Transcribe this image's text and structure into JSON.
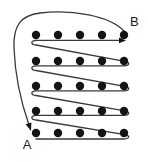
{
  "figure": {
    "background_color": "#ffffff",
    "width": 148,
    "height": 162
  },
  "labels": {
    "start": "A",
    "end": "B",
    "start_position": {
      "x": 27,
      "y": 149
    },
    "end_position": {
      "x": 130,
      "y": 26
    }
  },
  "colors": {
    "node": "#141414",
    "path": "#3a3a3a",
    "label": "#202020"
  },
  "grid": {
    "rows": 5,
    "columns": 5,
    "dot_radius": 4.2,
    "column_x": [
      36,
      58,
      80,
      102,
      124
    ],
    "row_y": [
      35,
      61,
      86,
      111,
      133
    ]
  },
  "paths": {
    "scan_path_d": "M 36 139 L 124 139 C 130 138.6 130 135.5 125 134.6 L 36 120 C 30.5 119.2 30.5 116 36 115.4 L 124 115.4 C 130 115 130 111.8 125 110.9 L 36 95.5 C 30.5 94.7 30.5 91.5 36 90.9 L 124 90.9 C 130 90.5 130 87.3 125 86.4 L 36 70.5 C 30.5 69.7 30.5 66.5 36 65.9 L 124 65.9 C 130 65.5 130 62.3 125 61.4 L 36 45 C 30.5 44.2 30.5 41 36 40.4 L 122 40.4",
    "scan_arrow_tip": {
      "x": 126,
      "y": 40.4
    },
    "return_path_d": "M 124 31 C 110 16 72 9 40 13 C 21 15.5 13 25 14 48 C 15 75 22 105 29 125",
    "return_arrow_tip": {
      "x": 31,
      "y": 131
    }
  },
  "nodes": [
    {
      "row": 0,
      "col": 0,
      "x": 36,
      "y": 35
    },
    {
      "row": 0,
      "col": 1,
      "x": 58,
      "y": 35
    },
    {
      "row": 0,
      "col": 2,
      "x": 80,
      "y": 35
    },
    {
      "row": 0,
      "col": 3,
      "x": 102,
      "y": 35
    },
    {
      "row": 0,
      "col": 4,
      "x": 124,
      "y": 35
    },
    {
      "row": 1,
      "col": 0,
      "x": 36,
      "y": 61
    },
    {
      "row": 1,
      "col": 1,
      "x": 58,
      "y": 61
    },
    {
      "row": 1,
      "col": 2,
      "x": 80,
      "y": 61
    },
    {
      "row": 1,
      "col": 3,
      "x": 102,
      "y": 61
    },
    {
      "row": 1,
      "col": 4,
      "x": 124,
      "y": 61
    },
    {
      "row": 2,
      "col": 0,
      "x": 36,
      "y": 86
    },
    {
      "row": 2,
      "col": 1,
      "x": 58,
      "y": 86
    },
    {
      "row": 2,
      "col": 2,
      "x": 80,
      "y": 86
    },
    {
      "row": 2,
      "col": 3,
      "x": 102,
      "y": 86
    },
    {
      "row": 2,
      "col": 4,
      "x": 124,
      "y": 86
    },
    {
      "row": 3,
      "col": 0,
      "x": 36,
      "y": 111
    },
    {
      "row": 3,
      "col": 1,
      "x": 58,
      "y": 111
    },
    {
      "row": 3,
      "col": 2,
      "x": 80,
      "y": 111
    },
    {
      "row": 3,
      "col": 3,
      "x": 102,
      "y": 111
    },
    {
      "row": 3,
      "col": 4,
      "x": 124,
      "y": 111
    },
    {
      "row": 4,
      "col": 0,
      "x": 36,
      "y": 133
    },
    {
      "row": 4,
      "col": 1,
      "x": 58,
      "y": 133
    },
    {
      "row": 4,
      "col": 2,
      "x": 80,
      "y": 133
    },
    {
      "row": 4,
      "col": 3,
      "x": 102,
      "y": 133
    },
    {
      "row": 4,
      "col": 4,
      "x": 124,
      "y": 133
    }
  ]
}
